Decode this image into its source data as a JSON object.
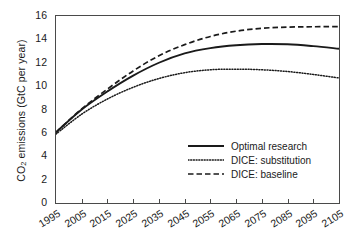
{
  "chart_data": {
    "type": "line",
    "title": "",
    "xlabel": "",
    "ylabel": "CO2 emissions (GtC per year)",
    "ylabel_parts": {
      "pre": "CO",
      "sub": "2",
      "post": " emissions (GtC per year)"
    },
    "xlim": [
      1995,
      2105
    ],
    "ylim": [
      0,
      16
    ],
    "ytick_step": 2,
    "grid": false,
    "legend_position": "lower-right inside axes",
    "xtick_labels": [
      "1995",
      "2005",
      "2015",
      "2025",
      "2035",
      "2045",
      "2055",
      "2065",
      "2075",
      "2085",
      "2095",
      "2105"
    ],
    "ytick_labels": [
      "0",
      "2",
      "4",
      "6",
      "8",
      "10",
      "12",
      "14",
      "16"
    ],
    "x": [
      1995,
      2005,
      2015,
      2025,
      2035,
      2045,
      2055,
      2065,
      2075,
      2085,
      2095,
      2105
    ],
    "series": [
      {
        "name": "Optimal research",
        "style": "solid",
        "color": "#1a1a1a",
        "values": [
          6.05,
          8.0,
          9.55,
          10.9,
          12.0,
          12.8,
          13.25,
          13.5,
          13.6,
          13.58,
          13.42,
          13.2
        ]
      },
      {
        "name": "DICE: substitution",
        "style": "dotted",
        "color": "#1a1a1a",
        "values": [
          5.9,
          7.6,
          8.9,
          9.9,
          10.65,
          11.15,
          11.4,
          11.45,
          11.4,
          11.25,
          11.0,
          10.7
        ]
      },
      {
        "name": "DICE: baseline",
        "style": "dashed",
        "color": "#1a1a1a",
        "values": [
          6.05,
          8.05,
          9.75,
          11.3,
          12.6,
          13.55,
          14.25,
          14.7,
          14.95,
          15.05,
          15.08,
          15.1
        ]
      }
    ]
  }
}
